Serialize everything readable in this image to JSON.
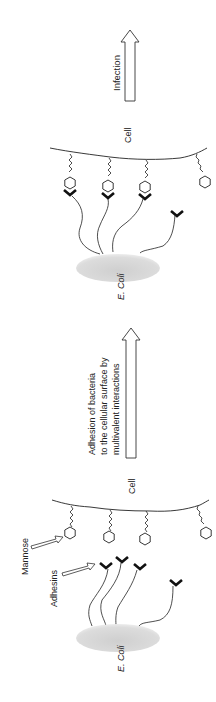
{
  "figure": {
    "top_panel": {
      "cell_label": "Cell",
      "bacterium_label": "E. Coli",
      "outcome_arrow_label": "Infection"
    },
    "transition": {
      "arrow_label_lines": [
        "Adhesion of bacteria",
        "to the cellular surface by",
        "multivalent interactions"
      ]
    },
    "bottom_panel": {
      "cell_label": "Cell",
      "bacterium_label": "E. Coli",
      "mannose_label": "Mannose",
      "adhesins_label": "Adhesins"
    },
    "colors": {
      "line": "#222222",
      "bacterium_fill": "#d4d4d4",
      "adhesin": "#111111"
    }
  }
}
